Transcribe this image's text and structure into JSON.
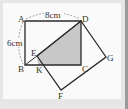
{
  "figure": {
    "points": {
      "A": {
        "label": "A",
        "x": 25,
        "y": 21
      },
      "D": {
        "label": "D",
        "x": 81,
        "y": 21
      },
      "B": {
        "label": "B",
        "x": 25,
        "y": 65
      },
      "C": {
        "label": "C",
        "x": 81,
        "y": 65
      },
      "E": {
        "label": "E",
        "x": 37,
        "y": 56
      },
      "K": {
        "label": "K",
        "x": 38,
        "y": 65
      },
      "G": {
        "label": "G",
        "x": 106,
        "y": 57
      },
      "F": {
        "label": "F",
        "x": 61,
        "y": 90
      }
    },
    "dimensions": {
      "AD": "8cm",
      "AB": "6cm"
    },
    "colors": {
      "stroke": "#2a2a2a",
      "shade": "#c8c8c8",
      "dashed": "#888888"
    }
  }
}
